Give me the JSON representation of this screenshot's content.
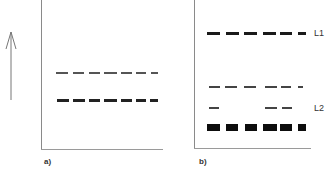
{
  "figure": {
    "arrow": {
      "direction": "up",
      "x": 11,
      "y_top": 32,
      "y_bottom": 100
    },
    "panels": [
      {
        "id": "a",
        "label": "a)",
        "frame": {
          "left": 41,
          "top": 0,
          "right": 163,
          "bottom": 149
        },
        "label_pos": {
          "x": 44,
          "y": 157
        },
        "bands": [
          {
            "name": "upper-thin-band",
            "y": 72,
            "height": 2,
            "color": "#555555",
            "dashes": [
              [
                56,
                68
              ],
              [
                73,
                84
              ],
              [
                89,
                100
              ],
              [
                104,
                117
              ],
              [
                121,
                132
              ],
              [
                136,
                146
              ],
              [
                151,
                158
              ]
            ]
          },
          {
            "name": "lower-thick-band",
            "y": 99,
            "height": 3,
            "color": "#222222",
            "dashes": [
              [
                57,
                69
              ],
              [
                73,
                85
              ],
              [
                89,
                100
              ],
              [
                104,
                117
              ],
              [
                121,
                132
              ],
              [
                136,
                146
              ],
              [
                150,
                158
              ]
            ]
          }
        ]
      },
      {
        "id": "b",
        "label": "b)",
        "frame": {
          "left": 194,
          "top": 0,
          "right": 311,
          "bottom": 148
        },
        "label_pos": {
          "x": 199,
          "y": 157
        },
        "bands": [
          {
            "name": "L1-band",
            "y": 32,
            "height": 3,
            "color": "#1a1a1a",
            "dashes": [
              [
                207,
                220
              ],
              [
                226,
                239
              ],
              [
                244,
                257
              ],
              [
                263,
                276
              ],
              [
                280,
                292
              ],
              [
                298,
                306
              ]
            ]
          },
          {
            "name": "L2-upper-thin-band",
            "y": 86,
            "height": 2,
            "color": "#444444",
            "dashes": [
              [
                209,
                220
              ],
              [
                225,
                237
              ],
              [
                244,
                256
              ],
              [
                265,
                277
              ],
              [
                281,
                291
              ],
              [
                298,
                303
              ]
            ]
          },
          {
            "name": "L2-middle-thin-band",
            "y": 107,
            "height": 2,
            "color": "#444444",
            "dashes": [
              [
                209,
                219
              ],
              [
                265,
                277
              ],
              [
                282,
                292
              ]
            ]
          },
          {
            "name": "L2-thick-blocks",
            "y": 124,
            "height": 7,
            "color": "#0d0d0d",
            "dashes": [
              [
                207,
                220
              ],
              [
                226,
                238
              ],
              [
                245,
                257
              ],
              [
                263,
                277
              ],
              [
                280,
                292
              ],
              [
                298,
                306
              ]
            ]
          }
        ],
        "side_labels": [
          {
            "text": "L1",
            "x": 314,
            "y": 28
          },
          {
            "text": "L2",
            "x": 314,
            "y": 103
          }
        ]
      }
    ]
  }
}
